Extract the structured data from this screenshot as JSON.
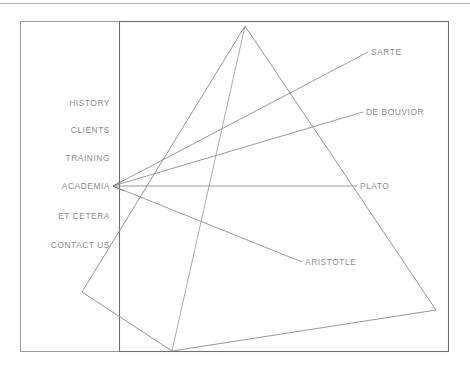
{
  "page": {
    "background_color": "#ffffff",
    "line_color": "#8a8a8a",
    "text_color": "#8c8c8c"
  },
  "top_rule": {
    "name": "top-divider"
  },
  "frames": {
    "outer": {
      "label": "outer-border"
    },
    "inner": {
      "label": "inner-border"
    }
  },
  "sidebar": {
    "name": "navigation-menu",
    "items": [
      {
        "label": "HISTORY"
      },
      {
        "label": "CLIENTS"
      },
      {
        "label": "TRAINING"
      },
      {
        "label": "ACADEMIA"
      },
      {
        "label": "ET CETERA"
      },
      {
        "label": "CONTACT US"
      }
    ]
  },
  "nodes": [
    {
      "label": "SARTE"
    },
    {
      "label": "DE BOUVIOR"
    },
    {
      "label": "PLATO"
    },
    {
      "label": "ARISTOTLE"
    }
  ],
  "diagram": {
    "shape": "pyramid",
    "hub": "ACADEMIA",
    "connector_count": 4
  }
}
